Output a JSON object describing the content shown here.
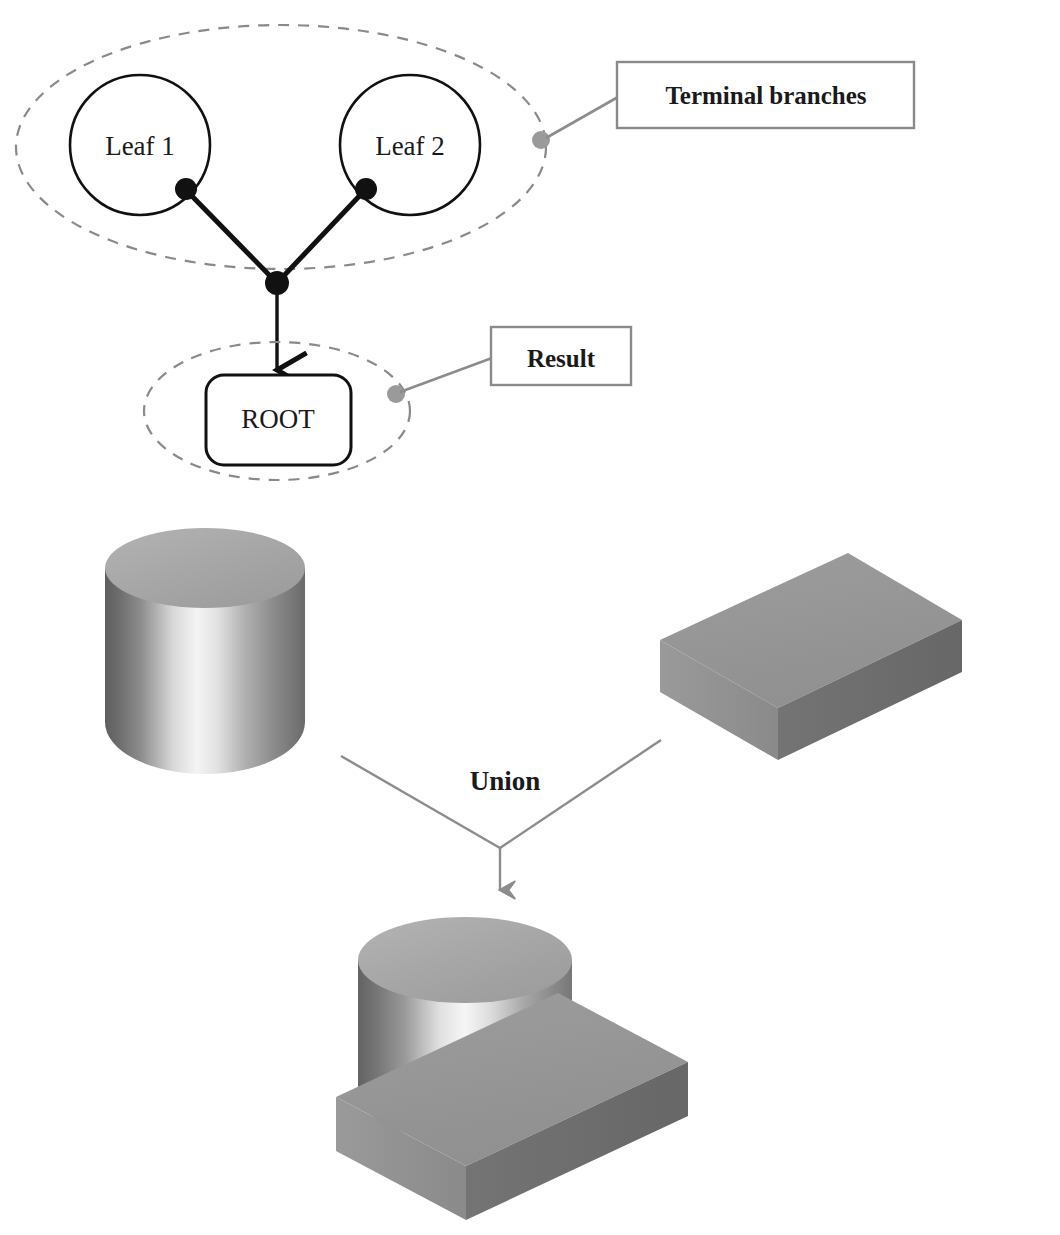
{
  "figure": {
    "background_color": "#ffffff"
  },
  "tree": {
    "leaves": [
      {
        "label": "Leaf 1"
      },
      {
        "label": "Leaf 2"
      }
    ],
    "root": {
      "label": "ROOT"
    },
    "callouts": [
      {
        "label": "Terminal branches",
        "target": "leaf-group-ellipse"
      },
      {
        "label": "Result",
        "target": "root-group-ellipse"
      }
    ],
    "colors": {
      "node_stroke": "#111111",
      "edge": "#111111",
      "group_dash": "#8a8a8a",
      "callout_line": "#8c8c8c",
      "callout_box_border": "#8a8a8a",
      "callout_dot": "#9a9a9a",
      "text": "#1a1a1a"
    }
  },
  "operation": {
    "label": "Union",
    "arrow_color": "#8c8c8c"
  },
  "solids": {
    "operand_a": {
      "name": "cylinder"
    },
    "operand_b": {
      "name": "block"
    },
    "result": {
      "name": "cylinder-block-union"
    },
    "colors": {
      "top_face": "#a8a8a8",
      "top_face_light": "#b4b4b4",
      "front_face_dark": "#6e6e6e",
      "front_face_light": "#f2f2f2",
      "side_face": "#7d7d7d",
      "slab_top": "#969696",
      "slab_front": "#8f8f8f",
      "slab_side": "#6b6b6b"
    }
  }
}
